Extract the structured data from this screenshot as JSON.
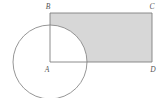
{
  "figure": {
    "type": "geometry-diagram",
    "canvas": {
      "width": 166,
      "height": 98,
      "background": "#ffffff"
    },
    "colors": {
      "stroke": "#808080",
      "circle_stroke": "#8a8a8a",
      "shaded_fill": "#d7d7d7",
      "label_color": "#555555",
      "background": "#ffffff"
    },
    "circle": {
      "name": "circle-A",
      "center_label": "A",
      "center_x": 50,
      "center_y": 62,
      "radius": 37,
      "fill": "none"
    },
    "rectangle": {
      "name": "rectangle-ABCD",
      "left": 50,
      "top": 13,
      "right": 152,
      "bottom": 62,
      "width": 102,
      "height": 49
    },
    "shaded_region": {
      "name": "shaded-region",
      "description": "rectangle ABCD minus the quarter circle in its lower-left corner",
      "fill": "#d7d7d7"
    },
    "vertices": [
      {
        "id": "B",
        "label": "B",
        "x": 50,
        "y": 13,
        "label_x": 48,
        "label_y": 9
      },
      {
        "id": "C",
        "label": "C",
        "x": 152,
        "y": 13,
        "label_x": 150,
        "label_y": 9
      },
      {
        "id": "A",
        "label": "A",
        "x": 50,
        "y": 62,
        "label_x": 46,
        "label_y": 72
      },
      {
        "id": "D",
        "label": "D",
        "x": 152,
        "y": 62,
        "label_x": 150,
        "label_y": 72
      }
    ],
    "segments": [
      {
        "id": "AB",
        "name": "segment-ab",
        "x1": 50,
        "y1": 13,
        "x2": 50,
        "y2": 62
      },
      {
        "id": "BC",
        "name": "segment-bc",
        "x1": 50,
        "y1": 13,
        "x2": 152,
        "y2": 13
      },
      {
        "id": "CD",
        "name": "segment-cd",
        "x1": 152,
        "y1": 13,
        "x2": 152,
        "y2": 62
      },
      {
        "id": "AD",
        "name": "segment-ad",
        "x1": 50,
        "y1": 62,
        "x2": 152,
        "y2": 62
      }
    ]
  }
}
